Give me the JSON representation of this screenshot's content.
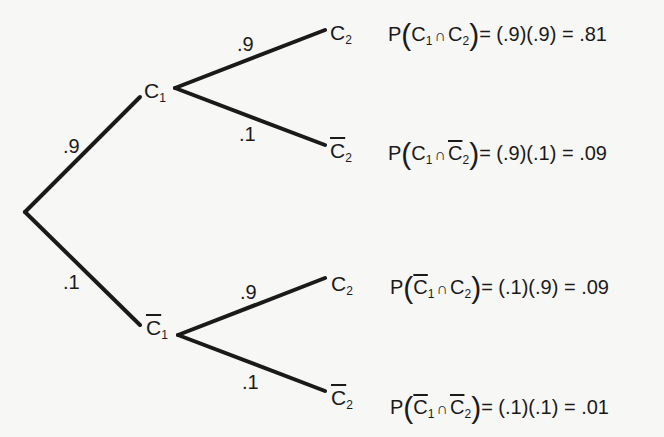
{
  "tree": {
    "root": {
      "x": 25,
      "y": 212
    },
    "stage1": [
      {
        "node": "C1",
        "complement": false,
        "prob": ".9"
      },
      {
        "node": "C1",
        "complement": true,
        "prob": ".1"
      }
    ],
    "stage2": [
      {
        "parent_complement": false,
        "node": "C2",
        "complement": false,
        "prob": ".9"
      },
      {
        "parent_complement": false,
        "node": "C2",
        "complement": true,
        "prob": ".1"
      },
      {
        "parent_complement": true,
        "node": "C2",
        "complement": false,
        "prob": ".9"
      },
      {
        "parent_complement": true,
        "node": "C2",
        "complement": true,
        "prob": ".1"
      }
    ]
  },
  "labels": {
    "p_c1": ".9",
    "p_c1bar": ".1",
    "p_c2_given_c1": ".9",
    "p_c2bar_given_c1": ".1",
    "p_c2_given_c1bar": ".9",
    "p_c2bar_given_c1bar": ".1"
  },
  "nodes": {
    "C": "C",
    "sub1": "1",
    "sub2": "2"
  },
  "equations": [
    {
      "P": "P",
      "cap": "∩",
      "rhs": "= (.9)(.9) = .81",
      "result": ".81"
    },
    {
      "P": "P",
      "cap": "∩",
      "rhs": "= (.9)(.1) = .09",
      "result": ".09"
    },
    {
      "P": "P",
      "cap": "∩",
      "rhs": "= (.1)(.9) = .09",
      "result": ".09"
    },
    {
      "P": "P",
      "cap": "∩",
      "rhs": "= (.1)(.1) = .01",
      "result": ".01"
    }
  ]
}
